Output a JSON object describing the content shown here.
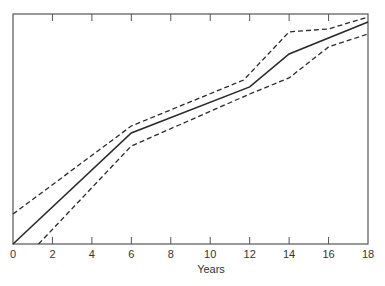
{
  "chart_data": {
    "type": "line",
    "title": "",
    "xlabel": "Years",
    "ylabel": "",
    "xlim": [
      0,
      18
    ],
    "ylim": [
      0,
      100
    ],
    "y_axis_note": "Y axis unlabeled; values expressed as percent of plot height",
    "x_ticks": [
      0,
      2,
      4,
      6,
      8,
      10,
      12,
      14,
      16,
      18
    ],
    "x_tick_labels": [
      "0",
      "2",
      "4",
      "6",
      "8",
      "10",
      "12",
      "14",
      "16",
      "18"
    ],
    "grid": false,
    "legend": null,
    "series": [
      {
        "name": "estimate",
        "style": "solid",
        "points": [
          [
            0,
            0
          ],
          [
            6,
            48.3
          ],
          [
            12,
            68.3
          ],
          [
            14,
            82.6
          ],
          [
            18,
            96.5
          ]
        ]
      },
      {
        "name": "upper bound",
        "style": "dashed",
        "points": [
          [
            0,
            13.0
          ],
          [
            6,
            51.3
          ],
          [
            11.7,
            71.3
          ],
          [
            14,
            92.2
          ],
          [
            16,
            93.5
          ],
          [
            18,
            98.7
          ]
        ]
      },
      {
        "name": "lower bound",
        "style": "dashed",
        "points": [
          [
            1.3,
            0
          ],
          [
            6,
            42.6
          ],
          [
            12,
            65.2
          ],
          [
            14,
            72.2
          ],
          [
            16,
            85.7
          ],
          [
            18,
            91.3
          ]
        ]
      }
    ]
  },
  "layout": {
    "plot": {
      "left": 13,
      "right": 368,
      "top": 14,
      "bottom": 244
    },
    "line_color": "#2a2a2a",
    "axis_color": "#555555"
  }
}
